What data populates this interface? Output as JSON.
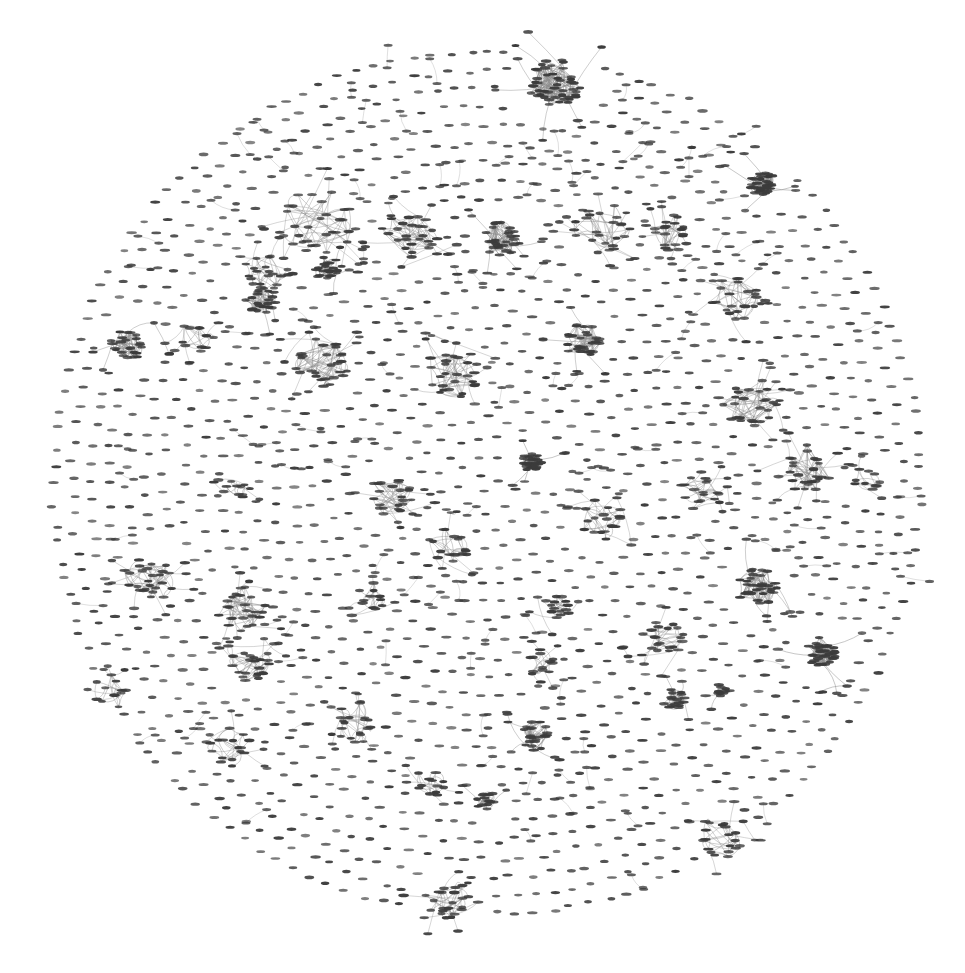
{
  "figure": {
    "title": "",
    "background_color": "#ffffff",
    "width": 965,
    "height": 973
  },
  "chart_data": {
    "type": "scatter",
    "subtype": "node-link-graph",
    "title": "",
    "subtitle": "",
    "xlabel": "",
    "ylabel": "",
    "grid": false,
    "legend": null,
    "axes_visible": false,
    "tick_labels": [],
    "annotations": [],
    "layout": {
      "name": "circular-packing",
      "center_x": 487,
      "center_y": 483,
      "radius": 442,
      "ring_spacing": 18.4,
      "node_spacing": 19.0
    },
    "node_style": {
      "shape": "horizontal-dash",
      "width": 9,
      "height": 3.1,
      "color": "#3b3b3b",
      "opacity": 0.88
    },
    "edge_style": {
      "color": "#8a8a8a",
      "width": 0.55,
      "opacity": 0.75,
      "curved": true
    },
    "counts": {
      "total_nodes": 3420,
      "isolated_nodes": 2715,
      "clustered_nodes": 705,
      "clusters": 44,
      "edges": 1480
    },
    "clusters": [
      {
        "id": 1,
        "cx": 553,
        "cy": 83,
        "r": 38,
        "n": 46,
        "density": "high",
        "label": "cluster-01"
      },
      {
        "id": 2,
        "cx": 763,
        "cy": 184,
        "r": 25,
        "n": 34,
        "density": "veryhigh",
        "label": "cluster-02"
      },
      {
        "id": 3,
        "cx": 318,
        "cy": 222,
        "r": 38,
        "n": 30,
        "density": "low",
        "label": "cluster-03"
      },
      {
        "id": 4,
        "cx": 410,
        "cy": 232,
        "r": 30,
        "n": 26,
        "density": "medium",
        "label": "cluster-04"
      },
      {
        "id": 5,
        "cx": 500,
        "cy": 240,
        "r": 27,
        "n": 30,
        "density": "high",
        "label": "cluster-05"
      },
      {
        "id": 6,
        "cx": 601,
        "cy": 228,
        "r": 28,
        "n": 24,
        "density": "low",
        "label": "cluster-06"
      },
      {
        "id": 7,
        "cx": 672,
        "cy": 231,
        "r": 22,
        "n": 20,
        "density": "low",
        "label": "cluster-07"
      },
      {
        "id": 8,
        "cx": 265,
        "cy": 272,
        "r": 24,
        "n": 18,
        "density": "low",
        "label": "cluster-08"
      },
      {
        "id": 9,
        "cx": 327,
        "cy": 268,
        "r": 18,
        "n": 20,
        "density": "high",
        "label": "cluster-09"
      },
      {
        "id": 10,
        "cx": 262,
        "cy": 300,
        "r": 22,
        "n": 22,
        "density": "high",
        "label": "cluster-10"
      },
      {
        "id": 11,
        "cx": 583,
        "cy": 340,
        "r": 26,
        "n": 28,
        "density": "high",
        "label": "cluster-11"
      },
      {
        "id": 12,
        "cx": 737,
        "cy": 299,
        "r": 27,
        "n": 24,
        "density": "low",
        "label": "cluster-12"
      },
      {
        "id": 13,
        "cx": 128,
        "cy": 344,
        "r": 24,
        "n": 24,
        "density": "high",
        "label": "cluster-13"
      },
      {
        "id": 14,
        "cx": 197,
        "cy": 337,
        "r": 18,
        "n": 12,
        "density": "low",
        "label": "cluster-14"
      },
      {
        "id": 15,
        "cx": 322,
        "cy": 363,
        "r": 29,
        "n": 28,
        "density": "medium",
        "label": "cluster-15"
      },
      {
        "id": 16,
        "cx": 452,
        "cy": 372,
        "r": 30,
        "n": 26,
        "density": "medium",
        "label": "cluster-16"
      },
      {
        "id": 17,
        "cx": 752,
        "cy": 403,
        "r": 30,
        "n": 26,
        "density": "medium",
        "label": "cluster-17"
      },
      {
        "id": 18,
        "cx": 806,
        "cy": 469,
        "r": 30,
        "n": 26,
        "density": "medium",
        "label": "cluster-18"
      },
      {
        "id": 19,
        "cx": 700,
        "cy": 490,
        "r": 22,
        "n": 18,
        "density": "low",
        "label": "cluster-19"
      },
      {
        "id": 20,
        "cx": 532,
        "cy": 462,
        "r": 19,
        "n": 26,
        "density": "veryhigh",
        "label": "cluster-20"
      },
      {
        "id": 21,
        "cx": 391,
        "cy": 496,
        "r": 25,
        "n": 22,
        "density": "medium",
        "label": "cluster-21"
      },
      {
        "id": 22,
        "cx": 237,
        "cy": 487,
        "r": 14,
        "n": 10,
        "density": "low",
        "label": "cluster-22"
      },
      {
        "id": 23,
        "cx": 602,
        "cy": 520,
        "r": 24,
        "n": 18,
        "density": "low",
        "label": "cluster-23"
      },
      {
        "id": 24,
        "cx": 450,
        "cy": 545,
        "r": 22,
        "n": 16,
        "density": "low",
        "label": "cluster-24"
      },
      {
        "id": 25,
        "cx": 148,
        "cy": 578,
        "r": 28,
        "n": 26,
        "density": "medium",
        "label": "cluster-25"
      },
      {
        "id": 26,
        "cx": 757,
        "cy": 585,
        "r": 30,
        "n": 30,
        "density": "high",
        "label": "cluster-26"
      },
      {
        "id": 27,
        "cx": 241,
        "cy": 608,
        "r": 28,
        "n": 24,
        "density": "medium",
        "label": "cluster-27"
      },
      {
        "id": 28,
        "cx": 556,
        "cy": 607,
        "r": 16,
        "n": 14,
        "density": "medium",
        "label": "cluster-28"
      },
      {
        "id": 29,
        "cx": 822,
        "cy": 652,
        "r": 30,
        "n": 34,
        "density": "veryhigh",
        "label": "cluster-29"
      },
      {
        "id": 30,
        "cx": 663,
        "cy": 637,
        "r": 24,
        "n": 20,
        "density": "low",
        "label": "cluster-30"
      },
      {
        "id": 31,
        "cx": 541,
        "cy": 662,
        "r": 16,
        "n": 12,
        "density": "low",
        "label": "cluster-31"
      },
      {
        "id": 32,
        "cx": 252,
        "cy": 664,
        "r": 24,
        "n": 22,
        "density": "medium",
        "label": "cluster-32"
      },
      {
        "id": 33,
        "cx": 674,
        "cy": 700,
        "r": 16,
        "n": 16,
        "density": "high",
        "label": "cluster-33"
      },
      {
        "id": 34,
        "cx": 721,
        "cy": 691,
        "r": 12,
        "n": 10,
        "density": "high",
        "label": "cluster-34"
      },
      {
        "id": 35,
        "cx": 352,
        "cy": 722,
        "r": 24,
        "n": 20,
        "density": "low",
        "label": "cluster-35"
      },
      {
        "id": 36,
        "cx": 534,
        "cy": 735,
        "r": 22,
        "n": 22,
        "density": "high",
        "label": "cluster-36"
      },
      {
        "id": 37,
        "cx": 231,
        "cy": 747,
        "r": 22,
        "n": 16,
        "density": "low",
        "label": "cluster-37"
      },
      {
        "id": 38,
        "cx": 430,
        "cy": 782,
        "r": 18,
        "n": 12,
        "density": "low",
        "label": "cluster-38"
      },
      {
        "id": 39,
        "cx": 485,
        "cy": 800,
        "r": 14,
        "n": 14,
        "density": "high",
        "label": "cluster-39"
      },
      {
        "id": 40,
        "cx": 722,
        "cy": 836,
        "r": 24,
        "n": 20,
        "density": "low",
        "label": "cluster-40"
      },
      {
        "id": 41,
        "cx": 448,
        "cy": 903,
        "r": 26,
        "n": 22,
        "density": "low",
        "label": "cluster-41"
      },
      {
        "id": 42,
        "cx": 370,
        "cy": 600,
        "r": 18,
        "n": 12,
        "density": "low",
        "label": "cluster-42"
      },
      {
        "id": 43,
        "cx": 110,
        "cy": 690,
        "r": 18,
        "n": 12,
        "density": "low",
        "label": "cluster-43"
      },
      {
        "id": 44,
        "cx": 866,
        "cy": 481,
        "r": 16,
        "n": 10,
        "density": "low",
        "label": "cluster-44"
      }
    ]
  }
}
